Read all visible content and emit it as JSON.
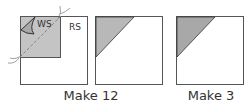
{
  "labels": {
    "ws": "WS",
    "rs": "RS",
    "make_a": "Make 12",
    "make_b": "Make 3"
  },
  "colors": {
    "stroke": "#555555",
    "fill_gray": "#b8b8b8",
    "fill_dark": "#a8a8a8",
    "dash": "#888888"
  }
}
